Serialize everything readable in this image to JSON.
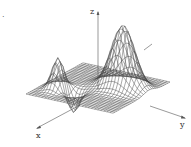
{
  "figure": {
    "label_mark": ".",
    "axes": {
      "x": "x",
      "y": "y",
      "z": "z"
    }
  },
  "surface": {
    "grid_n": 28,
    "range": [
      -3,
      3
    ],
    "peaks": [
      {
        "name": "large-peak",
        "amp": 2.6,
        "cx": -0.8,
        "cy": 1.2,
        "sx": 0.55,
        "sy": 0.75
      },
      {
        "name": "small-peak",
        "amp": 1.3,
        "cx": 1.3,
        "cy": -1.9,
        "sx": 0.4,
        "sy": 0.35
      },
      {
        "name": "dip",
        "amp": -0.9,
        "cx": 1.2,
        "cy": -0.9,
        "sx": 0.35,
        "sy": 0.35
      }
    ],
    "line_color": "#444444"
  }
}
